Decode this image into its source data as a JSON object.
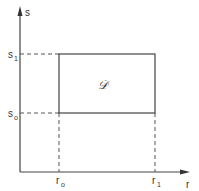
{
  "diagram": {
    "type": "rectangular-region-in-plane",
    "axes": {
      "horizontal": {
        "label": "r"
      },
      "vertical": {
        "label": "s"
      }
    },
    "ticks": {
      "r0": {
        "base": "r",
        "sub": "o"
      },
      "r1": {
        "base": "r",
        "sub": "1"
      },
      "s0": {
        "base": "s",
        "sub": "o"
      },
      "s1": {
        "base": "s",
        "sub": "1"
      }
    },
    "region_label": "𝒟",
    "colors": {
      "line": "#444444",
      "text": "#333333",
      "background": "#ffffff"
    }
  }
}
